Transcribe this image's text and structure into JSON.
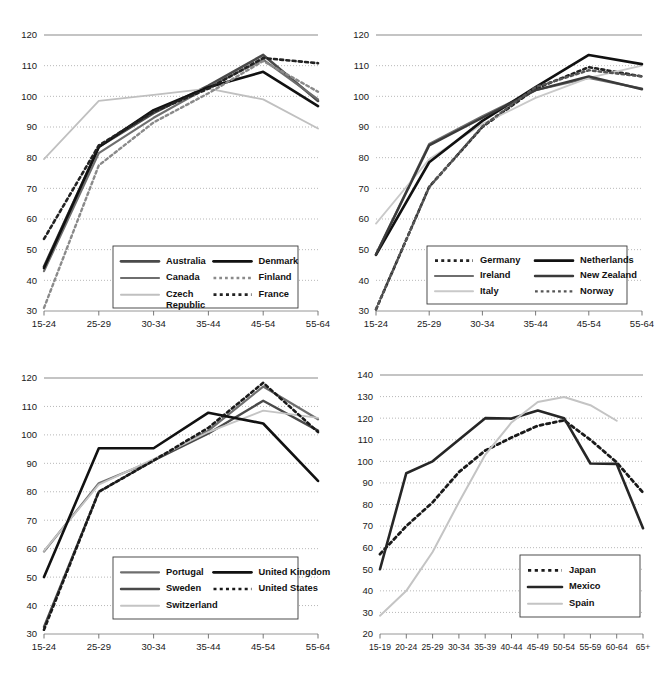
{
  "figure": {
    "panel_count": 4
  },
  "chart_data": [
    {
      "panel": "top-left",
      "type": "line",
      "title": "",
      "xlabel": "",
      "ylabel": "",
      "categories": [
        "15-24",
        "25-29",
        "30-34",
        "35-44",
        "45-54",
        "55-64"
      ],
      "ylim": [
        30,
        120
      ],
      "yticks": [
        30,
        40,
        50,
        60,
        70,
        80,
        90,
        100,
        110,
        120
      ],
      "grid": true,
      "legend_position": "bottom-center",
      "series": [
        {
          "name": "Australia",
          "style": "solid",
          "color": "#4a4a4a",
          "width": 2.6,
          "values": [
            44.5,
            83.5,
            94.5,
            103.5,
            113.5,
            98.5
          ]
        },
        {
          "name": "Canada",
          "style": "solid",
          "color": "#6e6e6e",
          "width": 2.2,
          "values": [
            43.0,
            81.5,
            93.0,
            103.0,
            112.0,
            99.0
          ]
        },
        {
          "name": "Czech Republic",
          "style": "solid",
          "color": "#c0c0c0",
          "width": 1.8,
          "values": [
            79.5,
            98.5,
            100.5,
            102.5,
            99.0,
            89.5
          ]
        },
        {
          "name": "Denmark",
          "style": "solid",
          "color": "#111111",
          "width": 2.6,
          "values": [
            44.0,
            83.5,
            95.5,
            103.0,
            108.0,
            96.8
          ]
        },
        {
          "name": "Finland",
          "style": "dotted",
          "color": "#8a8a8a",
          "width": 2.4,
          "values": [
            31.0,
            77.5,
            91.5,
            101.0,
            111.5,
            101.5
          ]
        },
        {
          "name": "France",
          "style": "dotted",
          "color": "#222222",
          "width": 2.6,
          "values": [
            53.5,
            84.0,
            95.0,
            102.5,
            112.5,
            110.8
          ]
        }
      ]
    },
    {
      "panel": "top-right",
      "type": "line",
      "title": "",
      "xlabel": "",
      "ylabel": "",
      "categories": [
        "15-24",
        "25-29",
        "30-34",
        "35-44",
        "45-54",
        "55-64"
      ],
      "ylim": [
        30,
        120
      ],
      "yticks": [
        30,
        40,
        50,
        60,
        70,
        80,
        90,
        100,
        110,
        120
      ],
      "grid": true,
      "legend_position": "bottom-center",
      "series": [
        {
          "name": "Germany",
          "style": "dotted",
          "color": "#222222",
          "width": 2.6,
          "values": [
            30.5,
            70.5,
            90.0,
            102.5,
            109.5,
            106.5
          ]
        },
        {
          "name": "Ireland",
          "style": "solid",
          "color": "#6e6e6e",
          "width": 2.2,
          "values": [
            48.5,
            84.5,
            93.5,
            102.0,
            106.0,
            102.5
          ]
        },
        {
          "name": "Italy",
          "style": "solid",
          "color": "#c9c9c9",
          "width": 1.8,
          "values": [
            58.5,
            79.5,
            91.0,
            99.5,
            106.0,
            110.0
          ]
        },
        {
          "name": "Netherlands",
          "style": "solid",
          "color": "#111111",
          "width": 2.6,
          "values": [
            48.3,
            78.5,
            92.0,
            103.0,
            113.5,
            110.5
          ]
        },
        {
          "name": "New Zealand",
          "style": "solid",
          "color": "#3a3a3a",
          "width": 2.4,
          "values": [
            48.4,
            84.0,
            93.0,
            102.0,
            106.5,
            102.3
          ]
        },
        {
          "name": "Norway",
          "style": "dotted",
          "color": "#555555",
          "width": 2.4,
          "values": [
            30.6,
            70.4,
            90.2,
            103.0,
            108.5,
            106.5
          ]
        }
      ]
    },
    {
      "panel": "bottom-left",
      "type": "line",
      "title": "",
      "xlabel": "",
      "ylabel": "",
      "categories": [
        "15-24",
        "25-29",
        "30-34",
        "35-44",
        "45-54",
        "55-64"
      ],
      "ylim": [
        30,
        120
      ],
      "yticks": [
        30,
        40,
        50,
        60,
        70,
        80,
        90,
        100,
        110,
        120
      ],
      "grid": true,
      "legend_position": "bottom-center",
      "series": [
        {
          "name": "Portugal",
          "style": "solid",
          "color": "#6e6e6e",
          "width": 2.2,
          "values": [
            59.0,
            83.0,
            91.0,
            101.5,
            117.0,
            105.5
          ]
        },
        {
          "name": "Sweden",
          "style": "solid",
          "color": "#4a4a4a",
          "width": 2.4,
          "values": [
            32.5,
            80.0,
            91.0,
            100.5,
            112.0,
            101.5
          ]
        },
        {
          "name": "Switzerland",
          "style": "solid",
          "color": "#c4c4c4",
          "width": 1.8,
          "values": [
            59.2,
            82.5,
            91.5,
            101.0,
            108.5,
            106.0
          ]
        },
        {
          "name": "United Kingdom",
          "style": "solid",
          "color": "#111111",
          "width": 2.6,
          "values": [
            50.0,
            95.3,
            95.3,
            107.8,
            104.0,
            83.8
          ]
        },
        {
          "name": "United States",
          "style": "dotted",
          "color": "#1a1a1a",
          "width": 2.6,
          "values": [
            31.5,
            80.0,
            91.0,
            102.5,
            118.3,
            101.0
          ]
        }
      ]
    },
    {
      "panel": "bottom-right",
      "type": "line",
      "title": "",
      "xlabel": "",
      "ylabel": "",
      "categories": [
        "15-19",
        "20-24",
        "25-29",
        "30-34",
        "35-39",
        "40-44",
        "45-49",
        "50-54",
        "55-59",
        "60-64",
        "65+"
      ],
      "ylim": [
        20,
        140
      ],
      "yticks": [
        20,
        30,
        40,
        50,
        60,
        70,
        80,
        90,
        100,
        110,
        120,
        130,
        140
      ],
      "grid": true,
      "legend_position": "bottom-right",
      "series": [
        {
          "name": "Japan",
          "style": "dotted",
          "color": "#1a1a1a",
          "width": 2.8,
          "values": [
            57.0,
            70.0,
            81.0,
            95.0,
            105.0,
            111.0,
            116.5,
            119.0,
            110.0,
            99.5,
            85.5
          ]
        },
        {
          "name": "Mexico",
          "style": "solid",
          "color": "#262626",
          "width": 2.6,
          "values": [
            50.0,
            94.5,
            100.0,
            110.0,
            120.0,
            119.8,
            123.5,
            120.0,
            99.0,
            98.8,
            69.0
          ]
        },
        {
          "name": "Spain",
          "style": "solid",
          "color": "#c4c4c4",
          "width": 2.0,
          "values": [
            28.5,
            40.0,
            58.0,
            81.0,
            103.0,
            118.0,
            127.5,
            129.8,
            126.0,
            118.8,
            null
          ]
        }
      ]
    }
  ]
}
